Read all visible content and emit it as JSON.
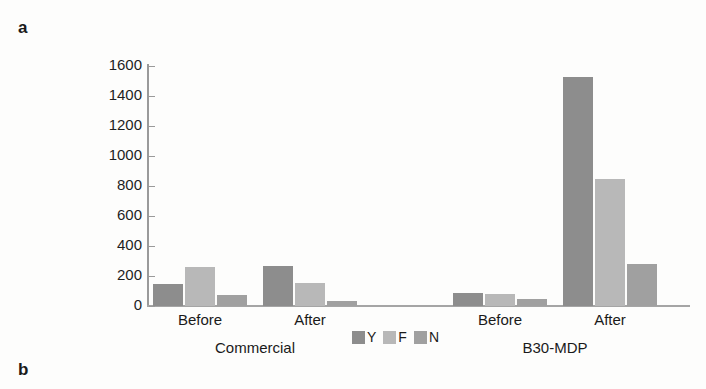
{
  "panels": {
    "a": "a",
    "b": "b"
  },
  "chart_data": {
    "type": "bar",
    "title": "",
    "xlabel": "",
    "ylabel": "",
    "ylim": [
      0,
      1600
    ],
    "yticks": [
      0,
      200,
      400,
      600,
      800,
      1000,
      1200,
      1400,
      1600
    ],
    "ytick_labels": [
      "0",
      "200",
      "400",
      "600",
      "800",
      "1000",
      "1200",
      "1400",
      "1600"
    ],
    "grid": false,
    "legend_position": "bottom-center",
    "legend": [
      "Y",
      "F",
      "N"
    ],
    "series": [
      {
        "name": "Y",
        "color": "#8d8d8d",
        "values": [
          150,
          265,
          90,
          1530
        ]
      },
      {
        "name": "F",
        "color": "#b8b8b8",
        "values": [
          262,
          152,
          80,
          845
        ]
      },
      {
        "name": "N",
        "color": "#a0a0a0",
        "values": [
          72,
          32,
          45,
          282
        ]
      }
    ],
    "categories": [
      "Before",
      "After",
      "Before",
      "After"
    ],
    "groups": [
      {
        "label": "Commercial",
        "categories": [
          "Before",
          "After"
        ]
      },
      {
        "label": "B30-MDP",
        "categories": [
          "Before",
          "After"
        ]
      }
    ],
    "group_labels": [
      "Commercial",
      "B30-MDP"
    ],
    "category_labels": [
      "Before",
      "After",
      "Before",
      "After"
    ]
  },
  "colors": {
    "series_y": "#8d8d8d",
    "series_f": "#b8b8b8",
    "series_n": "#a0a0a0",
    "axis": "#9a9a9a",
    "text": "#1a1a1a",
    "background": "#fdfdfc"
  }
}
